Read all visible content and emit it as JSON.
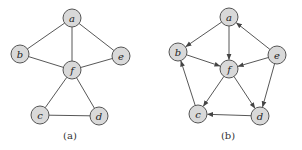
{
  "figure": {
    "graphs": [
      {
        "id": "a",
        "caption": "(a)",
        "caption_pos": [
          70,
          139
        ],
        "directed": false,
        "node_radius": 9,
        "nodes": [
          {
            "id": "a",
            "label": "a",
            "x": 72,
            "y": 18
          },
          {
            "id": "b",
            "label": "b",
            "x": 20,
            "y": 54
          },
          {
            "id": "e",
            "label": "e",
            "x": 121,
            "y": 56
          },
          {
            "id": "f",
            "label": "f",
            "x": 72,
            "y": 70
          },
          {
            "id": "c",
            "label": "c",
            "x": 40,
            "y": 115
          },
          {
            "id": "d",
            "label": "d",
            "x": 99,
            "y": 116
          }
        ],
        "edges": [
          {
            "from": "a",
            "to": "b"
          },
          {
            "from": "a",
            "to": "f"
          },
          {
            "from": "a",
            "to": "e"
          },
          {
            "from": "b",
            "to": "f"
          },
          {
            "from": "f",
            "to": "e"
          },
          {
            "from": "f",
            "to": "c"
          },
          {
            "from": "f",
            "to": "d"
          },
          {
            "from": "c",
            "to": "d"
          }
        ]
      },
      {
        "id": "b",
        "caption": "(b)",
        "caption_pos": [
          228,
          139
        ],
        "directed": true,
        "node_radius": 9,
        "nodes": [
          {
            "id": "a",
            "label": "a",
            "x": 229,
            "y": 17
          },
          {
            "id": "b",
            "label": "b",
            "x": 178,
            "y": 52
          },
          {
            "id": "e",
            "label": "e",
            "x": 277,
            "y": 55
          },
          {
            "id": "f",
            "label": "f",
            "x": 229,
            "y": 69
          },
          {
            "id": "c",
            "label": "c",
            "x": 198,
            "y": 114
          },
          {
            "id": "d",
            "label": "d",
            "x": 260,
            "y": 116
          }
        ],
        "edges": [
          {
            "from": "a",
            "to": "b"
          },
          {
            "from": "a",
            "to": "f"
          },
          {
            "from": "e",
            "to": "a"
          },
          {
            "from": "b",
            "to": "f"
          },
          {
            "from": "e",
            "to": "f"
          },
          {
            "from": "e",
            "to": "d"
          },
          {
            "from": "f",
            "to": "c"
          },
          {
            "from": "f",
            "to": "d"
          },
          {
            "from": "d",
            "to": "c"
          },
          {
            "from": "c",
            "to": "b"
          }
        ]
      }
    ],
    "colors": {
      "node_fill": "#d9d9d9",
      "node_stroke": "#555555",
      "edge": "#444444",
      "text": "#222222"
    }
  }
}
